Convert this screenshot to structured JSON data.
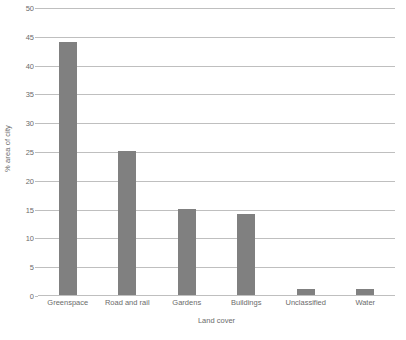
{
  "chart_data": {
    "type": "bar",
    "title": "",
    "categories": [
      "Greenspace",
      "Road and rail",
      "Gardens",
      "Buildings",
      "Unclassified",
      "Water"
    ],
    "values": [
      44,
      25,
      15,
      14,
      1,
      1
    ],
    "xlabel": "Land cover",
    "ylabel": "% area of city",
    "ylim": [
      0,
      50
    ],
    "ytick_step": 5,
    "yticks": [
      0,
      5,
      10,
      15,
      20,
      25,
      30,
      35,
      40,
      45,
      50
    ],
    "ytick_labels": [
      "0",
      "5",
      "10",
      "15",
      "20",
      "25",
      "30",
      "35",
      "40",
      "45",
      "50"
    ],
    "grid": "horizontal",
    "legend": "none",
    "bar_color": "#808080",
    "gridline_color": "#bfbfbf",
    "background_color": "#ffffff",
    "text_color": "#6b6b6b"
  }
}
